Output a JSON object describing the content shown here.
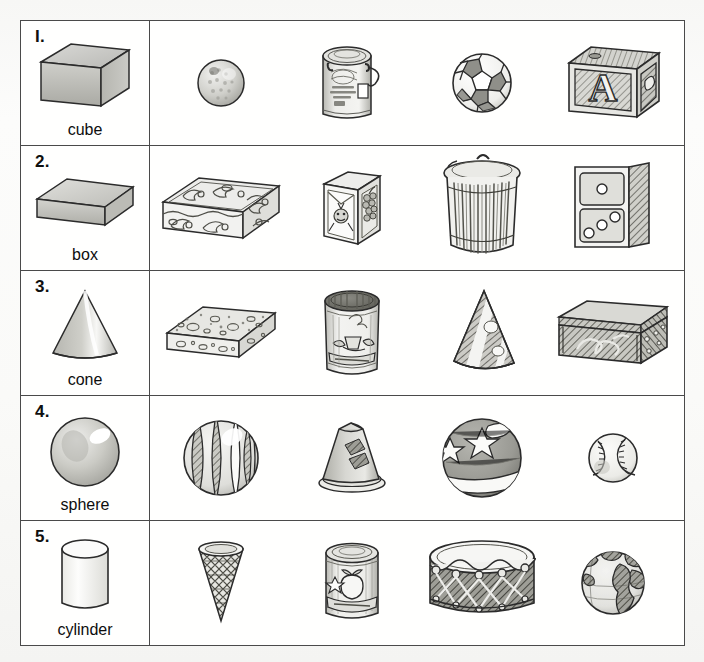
{
  "worksheet": {
    "title": "Solid Shapes Matching Worksheet",
    "background_color": "#fbfbfa",
    "table_border_color": "#4a4a4a",
    "ink_color": "#2b2b2b",
    "rows": [
      {
        "number": "I.",
        "shape_name": "cube",
        "shape_icon": "cube-icon",
        "objects": [
          {
            "name": "golf-ball",
            "label": "golf ball"
          },
          {
            "name": "paint-can",
            "label": "paint can"
          },
          {
            "name": "soccer-ball",
            "label": "soccer ball"
          },
          {
            "name": "alphabet-block",
            "label": "alphabet block",
            "letter": "A"
          }
        ]
      },
      {
        "number": "2.",
        "shape_name": "box",
        "shape_icon": "rectangular-box-icon",
        "objects": [
          {
            "name": "jewelry-box",
            "label": "decorated jewelry box"
          },
          {
            "name": "cereal-carton",
            "label": "juice carton box"
          },
          {
            "name": "trash-can",
            "label": "trash can"
          },
          {
            "name": "domino",
            "label": "domino",
            "pips_top": 1,
            "pips_bottom": 3
          }
        ]
      },
      {
        "number": "3.",
        "shape_name": "cone",
        "shape_icon": "cone-icon",
        "objects": [
          {
            "name": "sponge",
            "label": "sponge"
          },
          {
            "name": "coffee-can",
            "label": "coffee can"
          },
          {
            "name": "party-hat",
            "label": "striped party hat"
          },
          {
            "name": "treasure-box",
            "label": "decorated chest box"
          }
        ]
      },
      {
        "number": "4.",
        "shape_name": "sphere",
        "shape_icon": "sphere-icon",
        "objects": [
          {
            "name": "beach-ball",
            "label": "beach ball"
          },
          {
            "name": "traffic-cone",
            "label": "traffic cone"
          },
          {
            "name": "star-ball",
            "label": "star patterned ball"
          },
          {
            "name": "baseball",
            "label": "baseball"
          }
        ]
      },
      {
        "number": "5.",
        "shape_name": "cylinder",
        "shape_icon": "cylinder-icon",
        "objects": [
          {
            "name": "ice-cream-cone",
            "label": "ice cream cone"
          },
          {
            "name": "fruit-can",
            "label": "canned fruit"
          },
          {
            "name": "drum",
            "label": "drum"
          },
          {
            "name": "globe",
            "label": "globe"
          }
        ]
      }
    ]
  }
}
